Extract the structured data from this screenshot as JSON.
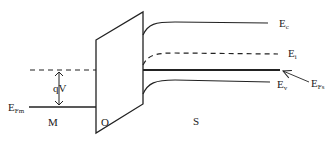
{
  "diagram": {
    "regions": {
      "metal": "M",
      "oxide": "O",
      "semiconductor": "S"
    },
    "labels": {
      "metal_fermi_main": "E",
      "metal_fermi_sub": "Fm",
      "voltage_drop": "qV",
      "conduction_main": "E",
      "conduction_sub": "c",
      "intrinsic_main": "E",
      "intrinsic_sub": "i",
      "valence_main": "E",
      "valence_sub": "v",
      "semi_fermi_main": "E",
      "semi_fermi_sub": "Fs"
    },
    "colors": {
      "line": "#222222",
      "background": "#ffffff"
    }
  }
}
